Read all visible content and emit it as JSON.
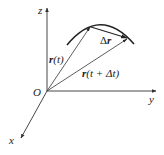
{
  "diagram": {
    "axes": {
      "z_label": "z",
      "y_label": "y",
      "x_label": "x",
      "origin_label": "O"
    },
    "vectors": {
      "r_t": {
        "bold": "r",
        "rest": "(t)"
      },
      "r_t_dt": {
        "bold": "r",
        "rest": "(t + Δt)"
      },
      "delta_r": {
        "prefix": "Δ",
        "bold": "r"
      }
    },
    "colors": {
      "stroke": "#333333",
      "curve": "#222222"
    }
  }
}
